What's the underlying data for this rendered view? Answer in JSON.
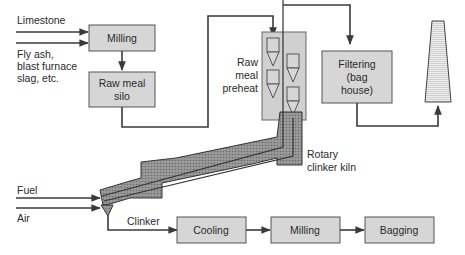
{
  "diagram": {
    "type": "process-flow",
    "title": "",
    "inputs": {
      "limestone": "Limestone",
      "fly_ash_1": "Fly ash,",
      "fly_ash_2": "blast furnace",
      "fly_ash_3": "slag, etc.",
      "fuel": "Fuel",
      "air": "Air"
    },
    "nodes": {
      "milling_top": "Milling",
      "silo_1": "Raw meal",
      "silo_2": "silo",
      "preheat_1": "Raw",
      "preheat_2": "meal",
      "preheat_3": "preheat",
      "filter_1": "Filtering",
      "filter_2": "(bag",
      "filter_3": "house)",
      "kiln_1": "Rotary",
      "kiln_2": "clinker kiln",
      "clinker": "Clinker",
      "cooling": "Cooling",
      "milling_bottom": "Milling",
      "bagging": "Bagging"
    },
    "edges": [
      {
        "from": "Limestone",
        "to": "Milling"
      },
      {
        "from": "Fly ash, blast furnace slag, etc.",
        "to": "Milling"
      },
      {
        "from": "Milling",
        "to": "Raw meal silo"
      },
      {
        "from": "Raw meal silo",
        "to": "Raw meal preheat"
      },
      {
        "from": "Raw meal preheat",
        "to": "Rotary clinker kiln"
      },
      {
        "from": "Rotary clinker kiln",
        "to": "Filtering (bag house)"
      },
      {
        "from": "Filtering (bag house)",
        "to": "Stack"
      },
      {
        "from": "Fuel",
        "to": "Rotary clinker kiln"
      },
      {
        "from": "Air",
        "to": "Rotary clinker kiln"
      },
      {
        "from": "Rotary clinker kiln",
        "to": "Cooling",
        "label": "Clinker"
      },
      {
        "from": "Cooling",
        "to": "Milling"
      },
      {
        "from": "Milling",
        "to": "Bagging"
      }
    ],
    "colors": {
      "box_fill": "#d6d6d6",
      "box_stroke": "#555555",
      "line": "#3a3a3a",
      "kiln_fill": "#8a8a8a",
      "text": "#2a2a2a"
    }
  }
}
